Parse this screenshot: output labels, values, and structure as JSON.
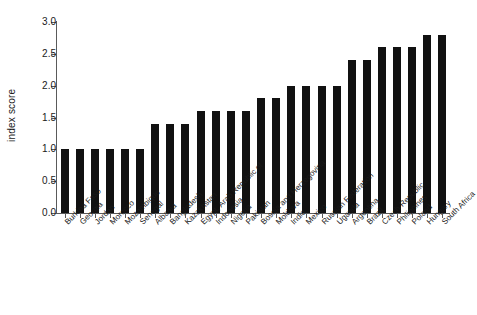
{
  "chart_data": {
    "type": "bar",
    "title": "",
    "subtitle": "",
    "xlabel": "",
    "ylabel": "index score",
    "ylim": [
      0.0,
      3.0
    ],
    "ytick_labels": [
      "0.0",
      "0.5",
      "1.0",
      "1.5",
      "2.0",
      "2.5",
      "3.0"
    ],
    "ytick_values": [
      0.0,
      0.5,
      1.0,
      1.5,
      2.0,
      2.5,
      3.0
    ],
    "grid": false,
    "legend": null,
    "bar_color": "#111111",
    "axis_color": "#5a5a5a",
    "categories": [
      "Burkina Faso",
      "Georgia",
      "Jordan",
      "Morocco",
      "Mozambique",
      "Senegal",
      "Albania",
      "Bangladesh",
      "Kazakhstan",
      "Egypt, Arab Republic of",
      "Indonesia",
      "Nigeria",
      "Pakistan",
      "Bosnia and Herzegovina",
      "Moldova",
      "India",
      "Mexico",
      "Russian Federation",
      "Uganda",
      "Argentina",
      "Brazil",
      "Czech Republic",
      "Philippines",
      "Poland",
      "Hungary",
      "South Africa"
    ],
    "values": [
      1.0,
      1.0,
      1.0,
      1.0,
      1.0,
      1.0,
      1.4,
      1.4,
      1.4,
      1.6,
      1.6,
      1.6,
      1.6,
      1.8,
      1.8,
      2.0,
      2.0,
      2.0,
      2.0,
      2.4,
      2.4,
      2.6,
      2.6,
      2.6,
      2.8,
      2.8
    ]
  }
}
